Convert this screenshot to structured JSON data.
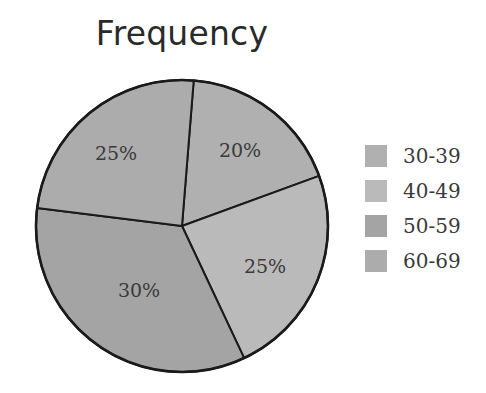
{
  "chart_data": {
    "type": "pie",
    "title": "Frequency",
    "categories": [
      "30-39",
      "40-49",
      "50-59",
      "60-69"
    ],
    "values": [
      20,
      25,
      30,
      25
    ],
    "labels": [
      "20%",
      "25%",
      "30%",
      "25%"
    ],
    "colors": [
      "#b0b0b0",
      "#bababa",
      "#a4a4a4",
      "#acacac"
    ],
    "legend_position": "right",
    "start_angle_deg": 4.6,
    "direction": "clockwise"
  },
  "title": "Frequency",
  "legend": {
    "items": [
      {
        "label": "30-39",
        "color": "#b0b0b0"
      },
      {
        "label": "40-49",
        "color": "#bababa"
      },
      {
        "label": "50-59",
        "color": "#a4a4a4"
      },
      {
        "label": "60-69",
        "color": "#acacac"
      }
    ]
  },
  "slices": [
    {
      "category": "30-39",
      "label": "20%"
    },
    {
      "category": "40-49",
      "label": "25%"
    },
    {
      "category": "50-59",
      "label": "30%"
    },
    {
      "category": "60-69",
      "label": "25%"
    }
  ]
}
